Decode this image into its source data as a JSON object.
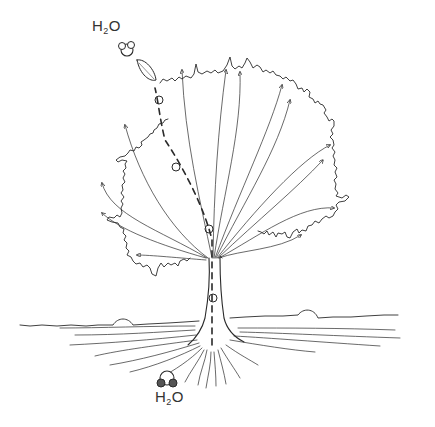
{
  "diagram": {
    "labels": {
      "top": {
        "main": "H",
        "sub": "2",
        "tail": "O"
      },
      "bottom": {
        "main": "H",
        "sub": "2",
        "tail": "O"
      }
    },
    "colors": {
      "background": "#ffffff",
      "ink": "#2a2a2a",
      "text": "#333333"
    },
    "elements": [
      "crown-outline",
      "trunk",
      "ground-line",
      "root-system",
      "transport-arrows",
      "water-molecule-path",
      "water-molecule-top",
      "water-molecule-bottom",
      "leaf"
    ]
  }
}
